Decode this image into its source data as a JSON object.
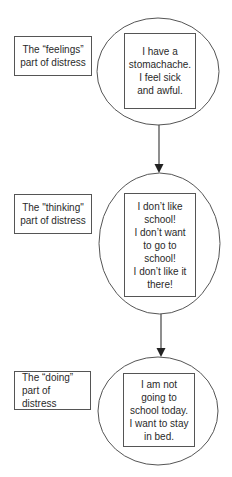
{
  "diagram": {
    "stages": [
      {
        "label": "The “feelings”\npart of distress",
        "content": "I have a\nstomachache.\nI feel sick\nand awful."
      },
      {
        "label": "The \"thinking\"\npart of distress",
        "content": "I don’t like\nschool!\nI don’t want\nto go to\nschool!\nI don’t like it\nthere!"
      },
      {
        "label": "The “doing”\npart of distress",
        "content": "I am not\ngoing to\nschool today.\nI want to stay\nin bed."
      }
    ],
    "connectors": [
      {
        "from": "stage-1",
        "to": "stage-2",
        "icon": "arrow-down-icon"
      },
      {
        "from": "stage-2",
        "to": "stage-3",
        "icon": "arrow-down-icon"
      }
    ],
    "colors": {
      "stroke": "#555555",
      "text": "#2a2a2a",
      "background": "#ffffff"
    }
  }
}
